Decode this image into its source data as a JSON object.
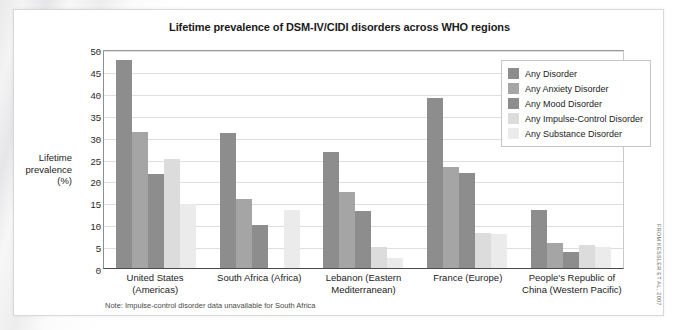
{
  "chart_data": {
    "type": "bar",
    "title": "Lifetime prevalence of DSM-IV/CIDI disorders across WHO regions",
    "xlabel": "",
    "ylabel": "Lifetime prevalence (%)",
    "ylim": [
      0,
      50
    ],
    "yticks": [
      0,
      5,
      10,
      15,
      20,
      25,
      30,
      35,
      40,
      45,
      50
    ],
    "grid": true,
    "legend_position": "top-right",
    "note": "Note: Impulse-control disorder data unavailable for South Africa",
    "credit": "FROM KESSLER ET AL, 2007",
    "categories": [
      "United States (Americas)",
      "South Africa (Africa)",
      "Lebanon (Eastern Mediterranean)",
      "France (Europe)",
      "People's Republic of China (Western Pacific)"
    ],
    "series": [
      {
        "name": "Any Disorder",
        "color": "#8d8d8d",
        "values": [
          47.4,
          30.8,
          26.6,
          38.9,
          13.2
        ]
      },
      {
        "name": "Any Anxiety Disorder",
        "color": "#a5a5a5",
        "values": [
          31.0,
          15.8,
          17.3,
          23.0,
          5.7
        ]
      },
      {
        "name": "Any Mood Disorder",
        "color": "#8d8d8d",
        "values": [
          21.4,
          9.8,
          13.0,
          21.8,
          3.6
        ]
      },
      {
        "name": "Any Impulse-Control Disorder",
        "color": "#dcdcdc",
        "values": [
          25.0,
          null,
          4.8,
          8.0,
          5.3
        ]
      },
      {
        "name": "Any Substance Disorder",
        "color": "#ebebeb",
        "values": [
          14.6,
          13.3,
          2.2,
          7.8,
          4.9
        ]
      }
    ]
  },
  "ylabel_lines": [
    "Lifetime",
    "prevalence",
    "(%)"
  ]
}
